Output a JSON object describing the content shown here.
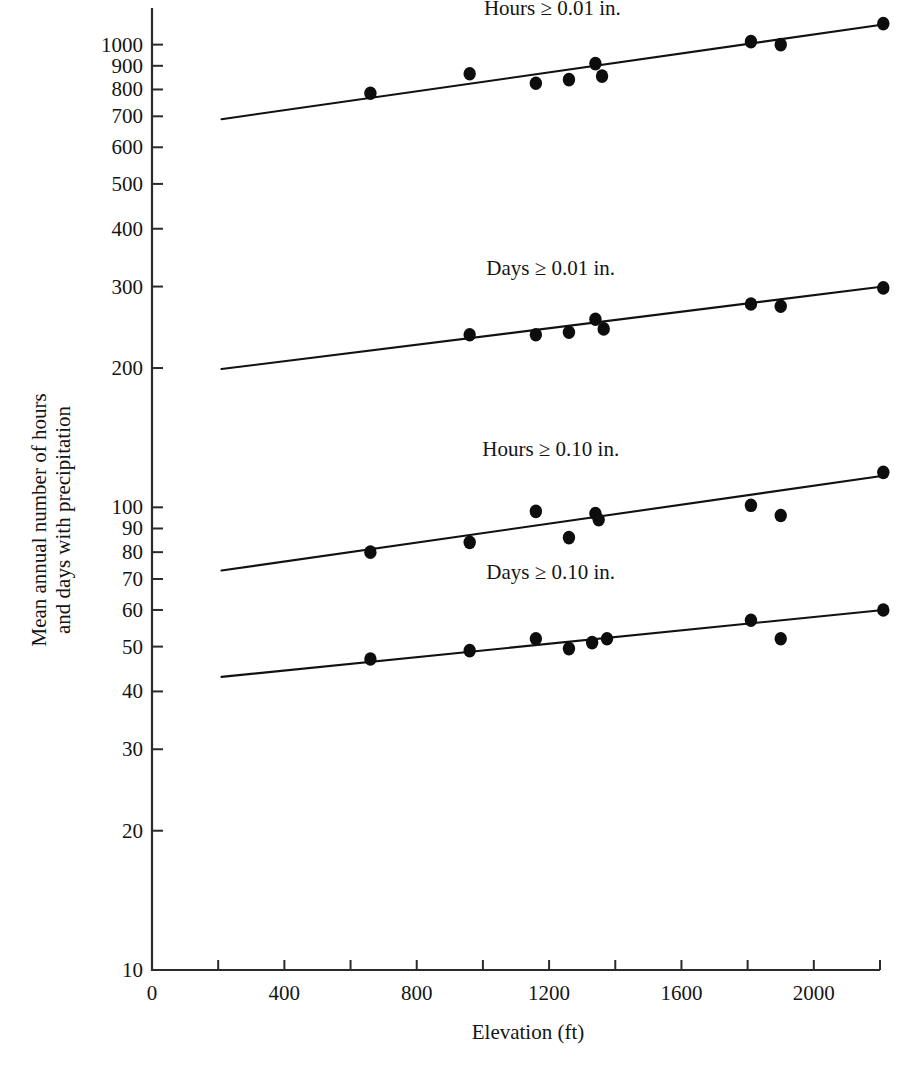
{
  "chart_data": {
    "type": "scatter",
    "title": "",
    "xlabel": "Elevation (ft)",
    "ylabel_line1": "Mean annual number of hours",
    "ylabel_line2": "and days with precipitation",
    "xlim": [
      0,
      2200
    ],
    "ylim": [
      10,
      1200
    ],
    "yscale": "log",
    "xscale": "linear",
    "grid": false,
    "legend_position": "inline-above-each-series",
    "xticks_major": [
      0,
      400,
      800,
      1200,
      1600,
      2000
    ],
    "xtick_labels": [
      "0",
      "400",
      "800",
      "1200",
      "1600",
      "2000"
    ],
    "xticks_minor": [
      200,
      600,
      1000,
      1400,
      1800,
      2200
    ],
    "yticks": [
      10,
      20,
      30,
      40,
      50,
      60,
      70,
      80,
      90,
      100,
      200,
      300,
      400,
      500,
      600,
      700,
      800,
      900,
      1000
    ],
    "ytick_labels": [
      "10",
      "20",
      "30",
      "40",
      "50",
      "60",
      "70",
      "80",
      "90",
      "100",
      "200",
      "300",
      "400",
      "500",
      "600",
      "700",
      "800",
      "900",
      "1000"
    ],
    "series": [
      {
        "name": "Hours ≥ 0.01 in.",
        "label": "Hours ≥ 0.01 in.",
        "label_x": 1210,
        "label_y": 1160,
        "fit_line": {
          "x0": 210,
          "y0": 690,
          "x1": 2210,
          "y1": 1105
        },
        "points": [
          {
            "x": 660,
            "y": 785
          },
          {
            "x": 960,
            "y": 865
          },
          {
            "x": 1160,
            "y": 825
          },
          {
            "x": 1260,
            "y": 840
          },
          {
            "x": 1340,
            "y": 910
          },
          {
            "x": 1360,
            "y": 855
          },
          {
            "x": 1810,
            "y": 1015
          },
          {
            "x": 1900,
            "y": 1000
          },
          {
            "x": 2210,
            "y": 1110
          }
        ]
      },
      {
        "name": "Days ≥ 0.01 in.",
        "label": "Days ≥ 0.01 in.",
        "label_x": 1205,
        "label_y": 318,
        "fit_line": {
          "x0": 210,
          "y0": 199,
          "x1": 2210,
          "y1": 300
        },
        "points": [
          {
            "x": 960,
            "y": 236
          },
          {
            "x": 1160,
            "y": 236
          },
          {
            "x": 1260,
            "y": 239
          },
          {
            "x": 1340,
            "y": 255
          },
          {
            "x": 1365,
            "y": 243
          },
          {
            "x": 1810,
            "y": 275
          },
          {
            "x": 1900,
            "y": 272
          },
          {
            "x": 2210,
            "y": 298
          }
        ]
      },
      {
        "name": "Hours ≥ 0.10 in.",
        "label": "Hours ≥ 0.10 in.",
        "label_x": 1205,
        "label_y": 129,
        "fit_line": {
          "x0": 210,
          "y0": 73,
          "x1": 2210,
          "y1": 117
        },
        "points": [
          {
            "x": 660,
            "y": 80
          },
          {
            "x": 960,
            "y": 84
          },
          {
            "x": 1160,
            "y": 98
          },
          {
            "x": 1260,
            "y": 86
          },
          {
            "x": 1340,
            "y": 97
          },
          {
            "x": 1350,
            "y": 94
          },
          {
            "x": 1810,
            "y": 101
          },
          {
            "x": 1900,
            "y": 96
          },
          {
            "x": 2210,
            "y": 119
          }
        ]
      },
      {
        "name": "Days ≥ 0.10 in.",
        "label": "Days ≥ 0.10 in.",
        "label_x": 1205,
        "label_y": 70,
        "fit_line": {
          "x0": 210,
          "y0": 43,
          "x1": 2210,
          "y1": 60
        },
        "points": [
          {
            "x": 660,
            "y": 47
          },
          {
            "x": 960,
            "y": 49
          },
          {
            "x": 1160,
            "y": 52
          },
          {
            "x": 1260,
            "y": 49.5
          },
          {
            "x": 1330,
            "y": 51
          },
          {
            "x": 1375,
            "y": 52
          },
          {
            "x": 1810,
            "y": 57
          },
          {
            "x": 1900,
            "y": 52
          },
          {
            "x": 2210,
            "y": 60
          }
        ]
      }
    ]
  }
}
